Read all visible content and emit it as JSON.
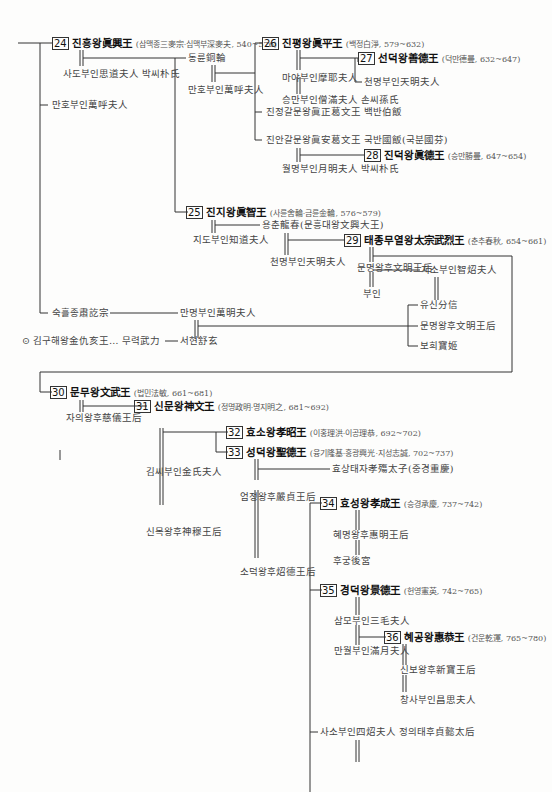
{
  "kings": [
    {
      "num": "24",
      "name": "진흥왕眞興王",
      "detail": "(삼맥종三麥宗·심맥부深麥夫, 540~576)"
    },
    {
      "num": "25",
      "name": "진지왕眞智王",
      "detail": "(사륜舍輪·금륜金輪, 576~579)"
    },
    {
      "num": "26",
      "name": "진평왕眞平王",
      "detail": "(백정白淨, 579~632)"
    },
    {
      "num": "27",
      "name": "선덕왕善德王",
      "detail": "(덕만德曼, 632~647)"
    },
    {
      "num": "28",
      "name": "진덕왕眞德王",
      "detail": "(승만勝曼, 647~654)"
    },
    {
      "num": "29",
      "name": "태종무열왕太宗武烈王",
      "detail": "(춘추春秋, 654~661)"
    },
    {
      "num": "30",
      "name": "문무왕文武王",
      "detail": "(법민法敏, 661~681)"
    },
    {
      "num": "31",
      "name": "신문왕神文王",
      "detail": "(정명政明·명지明之, 681~692)"
    },
    {
      "num": "32",
      "name": "효소왕孝昭王",
      "detail": "(이홍理洪·이공理恭, 692~702)"
    },
    {
      "num": "33",
      "name": "성덕왕聖德王",
      "detail": "(융기隆基·흥광興光·지성志誠, 702~737)"
    },
    {
      "num": "34",
      "name": "효성왕孝成王",
      "detail": "(승경承慶, 737~742)"
    },
    {
      "num": "35",
      "name": "경덕왕景德王",
      "detail": "(헌영憲英, 742~765)"
    },
    {
      "num": "36",
      "name": "혜공왕惠恭王",
      "detail": "(건운乾運, 765~780)"
    }
  ],
  "people": {
    "sado": "사도부인思道夫人 박씨朴氏",
    "manho1": "만호부인萬呼夫人",
    "dongryun": "동륜銅輪",
    "manho2": "만호부인萬呼夫人",
    "maya": "마야부인摩耶夫人",
    "seungman": "승만부인僧滿夫人 손씨孫氏",
    "cheonmyeong1": "천명부인天明夫人",
    "jinjeong": "진정갈문왕眞正葛文王 백반伯飯",
    "jinan": "진안갈문왕眞安葛文王 국반國飯(국분國芬)",
    "wolmyeong": "월명부인月明夫人 박씨朴氏",
    "jido": "지도부인知道夫人",
    "yongchun": "용춘龍春(문흥대왕文興大王)",
    "cheonmyeong2": "천명부인天明夫人",
    "munmyeong1": "문명왕후文明王后",
    "buin": "부인",
    "jiso": "지소부인智炤夫人",
    "yusin": "유신分信",
    "munmyeong2": "문명왕후文明王后",
    "bohui": "보희寶姬",
    "sukheul": "숙흘종肅訖宗",
    "manmyeong": "만명부인萬明夫人",
    "kimgu": "김구해왕金仇亥王… 무력武力",
    "seohyeon": "서현舒玄",
    "jaui": "자의왕후慈儀王后",
    "kimssi": "김씨부인金氏夫人",
    "sinmok": "신목왕후神穆王后",
    "eomjeong": "엄정왕후嚴貞王后",
    "hyosang": "효상태자孝殤太子(중경重慶)",
    "sodeok": "소덕왕후炤德王后",
    "hyemyeong": "혜명왕후惠明王后",
    "hugung": "후궁後宮",
    "sammo": "삼모부인三毛夫人",
    "manwol": "만월부인滿月夫人",
    "sinbo": "신보왕후新寶王后",
    "changsa": "창사부인昌思夫人",
    "saso": "사소부인四炤夫人 정의태후貞懿太后"
  },
  "marker_icon": "⊙"
}
